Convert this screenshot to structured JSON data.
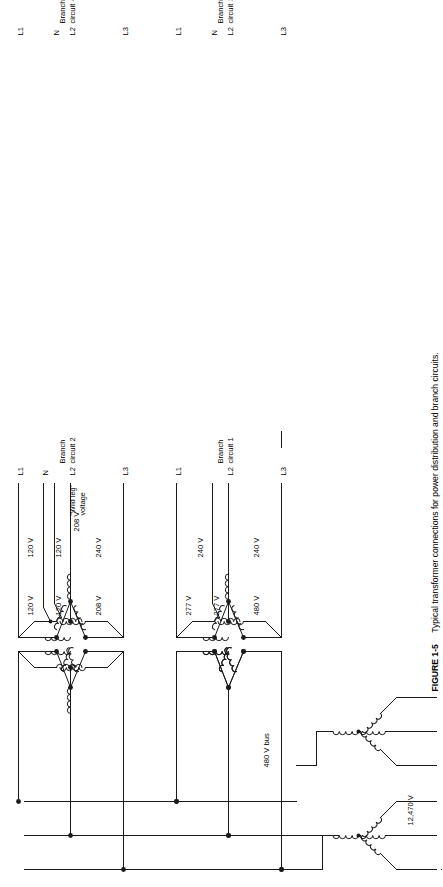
{
  "figure": {
    "number": "FIGURE 1-5",
    "caption": "Typical transformer connections for power distribution and branch circuits.",
    "caption_full": "FIGURE 1-5  Typical transformer connections for power distribution and branch circuits."
  },
  "source": {
    "primary_voltage_label": "12,470 V",
    "bus_label": "480 V bus",
    "bus_conductor_count": 3
  },
  "colors": {
    "line": "#1a1a1a",
    "text": "#000000",
    "background": "#ffffff"
  },
  "branch_circuits": [
    {
      "name": "Branch circuit 1",
      "name_line1": "Branch",
      "name_line2": "circuit 1",
      "primary": "delta",
      "secondary": "delta",
      "conductors": [
        "L1",
        "L2",
        "L3"
      ],
      "voltages": [
        "240 V",
        "240 V"
      ],
      "notes": []
    },
    {
      "name": "Branch circuit 2",
      "name_line1": "Branch",
      "name_line2": "circuit 2",
      "primary": "delta",
      "secondary": "delta-center-tap",
      "conductors": [
        "L1",
        "N",
        "L2",
        "L3"
      ],
      "voltages": [
        "120 V",
        "120 V",
        "240 V"
      ],
      "wild_leg_voltage": "208 V",
      "wild_leg_label_line1": "“Wild leg”",
      "wild_leg_label_line2": "voltage",
      "notes": [
        "208 V",
        "“Wild leg” voltage"
      ]
    },
    {
      "name": "Branch circuit 3",
      "name_line1": "Branch",
      "name_line2": "circuit 3",
      "primary": "delta",
      "secondary": "wye",
      "conductors": [
        "L1",
        "N",
        "L2",
        "L3"
      ],
      "voltages": [
        "277 V",
        "277 V",
        "480 V"
      ],
      "notes": []
    },
    {
      "name": "Branch circuit 4",
      "name_line1": "Branch",
      "name_line2": "circuit 4",
      "primary": "wye",
      "secondary": "wye",
      "conductors": [
        "L1",
        "N",
        "L2",
        "L3"
      ],
      "voltages": [
        "120 V",
        "120 V",
        "208 V"
      ],
      "notes": []
    }
  ]
}
